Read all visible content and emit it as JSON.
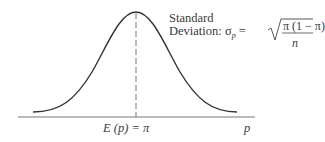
{
  "diagram": {
    "type": "normal-distribution-curve",
    "annotation": {
      "line1": "Standard",
      "line2_prefix": "Deviation: ",
      "sigma": "σ",
      "sigma_sub": "p",
      "equals": " = ",
      "numerator": "π (1 − π)",
      "denominator": "n"
    },
    "mean_label": "E (p) = π",
    "axis_label": "p",
    "colors": {
      "curve": "#333333",
      "axis": "#666666",
      "dash": "#555555",
      "text": "#3a3a3a"
    }
  }
}
